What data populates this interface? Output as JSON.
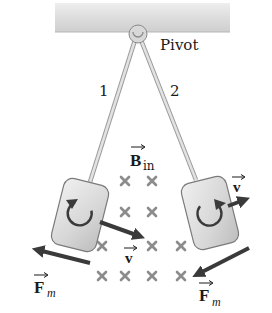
{
  "figure": {
    "labels": {
      "pivot": "Pivot",
      "rod1": "1",
      "rod2": "2",
      "field": "B",
      "field_sub": "in",
      "velocity_left": "v",
      "velocity_right": "v",
      "force_left": "F",
      "force_left_sub": "m",
      "force_right": "F",
      "force_right_sub": "m"
    },
    "field_marks": {
      "symbol": "×",
      "rows": [
        {
          "y": 181,
          "x": [
            125,
            152
          ]
        },
        {
          "y": 212,
          "x": [
            125,
            152
          ]
        },
        {
          "y": 246,
          "x": [
            102,
            152,
            181
          ]
        },
        {
          "y": 276,
          "x": [
            102,
            125,
            152,
            181
          ]
        }
      ]
    },
    "colors": {
      "ceiling": "#d9d9d9",
      "rod": "#c8c8c8",
      "plate": "#dcdcdc",
      "arrow": "#3a3a3a",
      "field_mark": "#8c8c8c",
      "text": "#1a1a1a"
    }
  }
}
